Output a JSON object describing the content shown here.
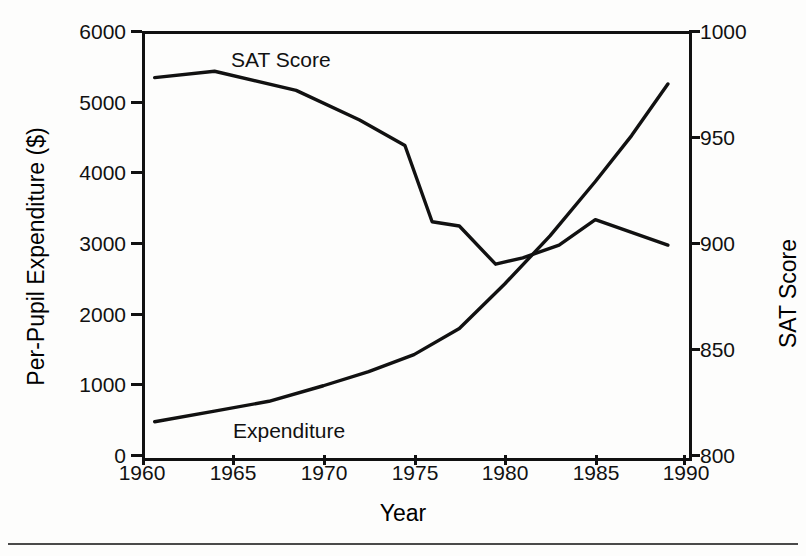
{
  "chart_data": {
    "type": "line",
    "title": "",
    "xlabel": "Year",
    "ylabel": "Per-Pupil Expenditure ($)",
    "ylabel_right": "SAT Score",
    "xlim": [
      1960,
      1990
    ],
    "ylim": [
      0,
      6000
    ],
    "ylim_right": [
      800,
      1000
    ],
    "xticks": [
      "1960",
      "1965",
      "1970",
      "1975",
      "1980",
      "1985",
      "1990"
    ],
    "xtick_values": [
      1960,
      1965,
      1970,
      1975,
      1980,
      1985,
      1990
    ],
    "yticks_left": [
      "0",
      "1000",
      "2000",
      "3000",
      "4000",
      "5000",
      "6000"
    ],
    "ytick_left_values": [
      0,
      1000,
      2000,
      3000,
      4000,
      5000,
      6000
    ],
    "yticks_right": [
      "800",
      "850",
      "900",
      "950",
      "1000"
    ],
    "ytick_right_values": [
      800,
      850,
      900,
      950,
      1000
    ],
    "grid": false,
    "legend": "inline-annotations",
    "series": [
      {
        "name": "SAT Score",
        "axis": "right",
        "annotation_label": "SAT Score",
        "x": [
          1960.7,
          1964.0,
          1968.5,
          1972.0,
          1974.5,
          1976.0,
          1977.5,
          1979.5,
          1981.0,
          1983.0,
          1985.0,
          1987.0,
          1989.0
        ],
        "values": [
          978,
          981,
          972,
          958,
          946,
          910,
          908,
          890,
          893,
          899,
          911,
          905,
          899
        ]
      },
      {
        "name": "Expenditure",
        "axis": "left",
        "annotation_label": "Expenditure",
        "x": [
          1960.7,
          1964.0,
          1967.0,
          1970.0,
          1972.5,
          1975.0,
          1977.5,
          1980.0,
          1982.5,
          1985.0,
          1987.0,
          1989.0
        ],
        "values": [
          470,
          620,
          760,
          980,
          1180,
          1420,
          1790,
          2420,
          3100,
          3870,
          4520,
          5250
        ]
      }
    ]
  },
  "axes": {
    "left_title": "Per-Pupil Expenditure ($)",
    "right_title": "SAT Score",
    "bottom_title": "Year"
  },
  "annotations": {
    "sat": "SAT Score",
    "expenditure": "Expenditure"
  },
  "colors": {
    "line": "#111111",
    "background": "#ffffff",
    "rule": "#4a4a4a"
  }
}
